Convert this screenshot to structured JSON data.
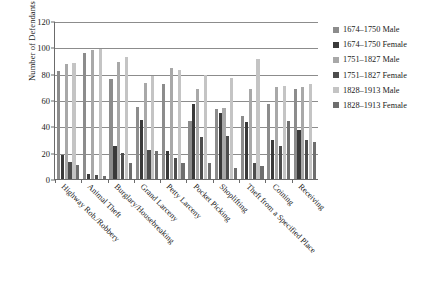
{
  "chart_data": {
    "type": "bar",
    "title": "",
    "xlabel": "",
    "ylabel": "Number of Defendants",
    "ylim": [
      0,
      120
    ],
    "yticks": [
      0,
      20,
      40,
      60,
      80,
      100,
      120
    ],
    "grid": true,
    "legend_position": "right",
    "categories": [
      "Highway Rob./Robbery",
      "Animal Theft",
      "Burglary/Housebreaking",
      "Grand Larceny",
      "Petty Larceny",
      "Pocket Picking",
      "Shoplifting",
      "Theft from a Specified Place",
      "Coining",
      "Receiving"
    ],
    "series": [
      {
        "name": "1674–1750 Male",
        "color": "#8c8c8c",
        "values": [
          82,
          96,
          76,
          55,
          72,
          44,
          53,
          48,
          57,
          68
        ]
      },
      {
        "name": "1674–1750 Female",
        "color": "#3a3a3a",
        "values": [
          18,
          4,
          25,
          45,
          21,
          57,
          50,
          43,
          30,
          37
        ]
      },
      {
        "name": "1751–1827 Male",
        "color": "#a8a8a8",
        "values": [
          87,
          98,
          89,
          73,
          84,
          68,
          54,
          68,
          70,
          70
        ]
      },
      {
        "name": "1751–1827 Female",
        "color": "#4d4d4d",
        "values": [
          13,
          3,
          20,
          22,
          16,
          32,
          33,
          12,
          25,
          30
        ]
      },
      {
        "name": "1828–1913 Male",
        "color": "#c4c4c4",
        "values": [
          88,
          99,
          93,
          78,
          83,
          79,
          77,
          91,
          71,
          72
        ]
      },
      {
        "name": "1828–1913 Female",
        "color": "#6e6e6e",
        "values": [
          11,
          2,
          12,
          21,
          12,
          12,
          8,
          10,
          44,
          28
        ]
      }
    ]
  }
}
